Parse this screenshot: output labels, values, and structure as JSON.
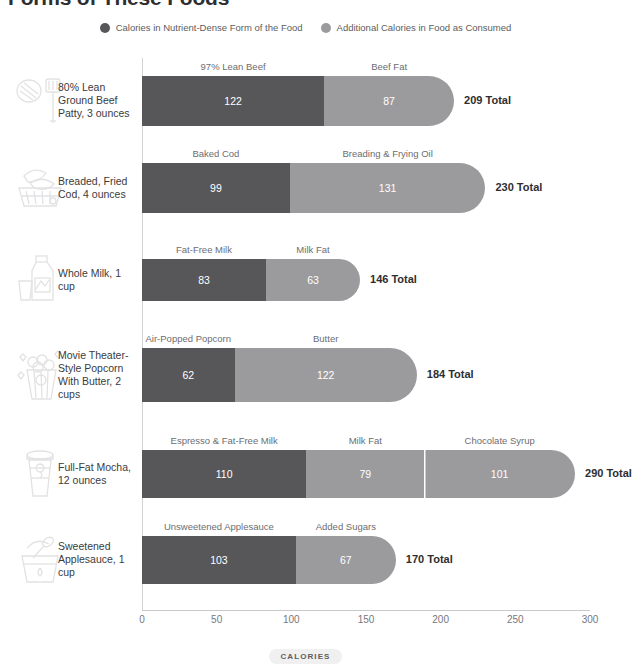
{
  "title": "Forms of These Foods",
  "legend": {
    "items": [
      {
        "label": "Calories in Nutrient-Dense Form of the Food",
        "color": "#57575a",
        "icon": "legend-dot-icon"
      },
      {
        "label": "Additional Calories in Food as Consumed",
        "color": "#9b9b9e",
        "icon": "legend-dot-icon"
      }
    ]
  },
  "axis": {
    "caption": "CALORIES",
    "ticks": [
      "0",
      "50",
      "100",
      "150",
      "200",
      "250",
      "300"
    ],
    "min": 0,
    "max": 300,
    "step": 50
  },
  "colors": {
    "dark": "#57575a",
    "light": "#9b9b9e",
    "icon": "#e2e2e4",
    "text": "#3b3b3d",
    "muted": "#6d6d70",
    "axis": "#c9c9cb",
    "badge_bg": "#f0f0f0"
  },
  "chart_data": {
    "type": "bar",
    "title": "Forms of These Foods",
    "xlabel": "CALORIES",
    "ylabel": "",
    "xlim": [
      0,
      300
    ],
    "grid": false,
    "legend_position": "top-center",
    "orientation": "horizontal",
    "stacked": true,
    "series": [
      {
        "name": "Calories in Nutrient-Dense Form of the Food",
        "color": "#57575a"
      },
      {
        "name": "Additional Calories in Food as Consumed",
        "color": "#9b9b9e"
      }
    ],
    "categories": [
      "80% Lean Ground Beef Patty, 3 ounces",
      "Breaded, Fried Cod, 4 ounces",
      "Whole Milk, 1 cup",
      "Movie Theater-Style Popcorn With Butter, 2 cups",
      "Full-Fat Mocha, 12 ounces",
      "Sweetened Applesauce, 1 cup"
    ],
    "rows": [
      {
        "label": "80% Lean Ground Beef Patty, 3 ounces",
        "icon": "beef-patty-spatula-icon",
        "total": 209,
        "total_label": "209 Total",
        "segments": [
          {
            "caption": "97% Lean Beef",
            "value": 122,
            "value_label": "122",
            "kind": "dark"
          },
          {
            "caption": "Beef Fat",
            "value": 87,
            "value_label": "87",
            "kind": "light"
          }
        ]
      },
      {
        "label": "Breaded, Fried Cod, 4 ounces",
        "icon": "fried-fish-basket-icon",
        "total": 230,
        "total_label": "230 Total",
        "segments": [
          {
            "caption": "Baked Cod",
            "value": 99,
            "value_label": "99",
            "kind": "dark"
          },
          {
            "caption": "Breading & Frying Oil",
            "value": 131,
            "value_label": "131",
            "kind": "light"
          }
        ]
      },
      {
        "label": "Whole Milk, 1 cup",
        "icon": "milk-jug-glass-icon",
        "total": 146,
        "total_label": "146 Total",
        "segments": [
          {
            "caption": "Fat-Free Milk",
            "value": 83,
            "value_label": "83",
            "kind": "dark"
          },
          {
            "caption": "Milk Fat",
            "value": 63,
            "value_label": "63",
            "kind": "light"
          }
        ]
      },
      {
        "label": "Movie Theater-Style Popcorn With Butter, 2 cups",
        "icon": "popcorn-bucket-icon",
        "total": 184,
        "total_label": "184 Total",
        "segments": [
          {
            "caption": "Air-Popped Popcorn",
            "value": 62,
            "value_label": "62",
            "kind": "dark"
          },
          {
            "caption": "Butter",
            "value": 122,
            "value_label": "122",
            "kind": "light"
          }
        ]
      },
      {
        "label": "Full-Fat Mocha, 12 ounces",
        "icon": "coffee-cup-icon",
        "total": 290,
        "total_label": "290 Total",
        "segments": [
          {
            "caption": "Espresso & Fat-Free Milk",
            "value": 110,
            "value_label": "110",
            "kind": "dark"
          },
          {
            "caption": "Milk Fat",
            "value": 79,
            "value_label": "79",
            "kind": "light"
          },
          {
            "caption": "Chocolate Syrup",
            "value": 101,
            "value_label": "101",
            "kind": "light",
            "divided": true
          }
        ]
      },
      {
        "label": "Sweetened Applesauce, 1 cup",
        "icon": "applesauce-bowl-spoon-icon",
        "total": 170,
        "total_label": "170 Total",
        "segments": [
          {
            "caption": "Unsweetened Applesauce",
            "value": 103,
            "value_label": "103",
            "kind": "dark"
          },
          {
            "caption": "Added Sugars",
            "value": 67,
            "value_label": "67",
            "kind": "light"
          }
        ]
      }
    ]
  }
}
